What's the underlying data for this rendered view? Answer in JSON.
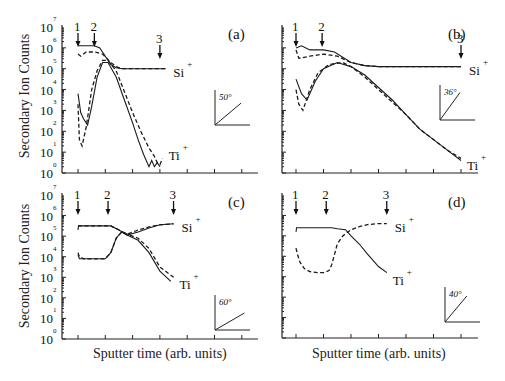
{
  "figure": {
    "ylabel": "Secondary Ion Counts",
    "xlabel": "Sputter time (arb. units)",
    "yticks_exp": [
      "0",
      "1",
      "2",
      "3",
      "4",
      "5",
      "6",
      "7"
    ],
    "ytick_base": "10"
  },
  "chart_data": [
    {
      "panel": "(a)",
      "type": "line",
      "angle_label": "50°",
      "angle_deg": 50,
      "xlabel": "",
      "ylabel": "Secondary Ion Counts",
      "yscale": "log",
      "ylim": [
        1,
        10000000
      ],
      "markers": [
        "1",
        "2",
        "3"
      ],
      "marker_x": [
        1.0,
        1.6,
        4.0
      ],
      "series_labels": [
        "Si+",
        "Ti+"
      ],
      "series": [
        {
          "name": "Si+ (solid)",
          "style": "solid",
          "x": [
            1.0,
            1.6,
            1.8,
            2.0,
            2.2,
            2.4,
            2.6,
            3.0,
            3.5,
            4.0,
            4.2
          ],
          "log10y": [
            6.1,
            6.1,
            6.0,
            5.6,
            5.2,
            5.05,
            5.0,
            5.0,
            5.0,
            5.0,
            5.0
          ]
        },
        {
          "name": "Si+ (dashed)",
          "style": "dashed",
          "x": [
            1.0,
            1.1,
            1.3,
            1.6,
            1.9,
            2.2,
            2.4,
            2.6,
            3.0,
            3.5,
            4.0,
            4.2
          ],
          "log10y": [
            5.7,
            5.6,
            5.8,
            5.8,
            5.7,
            5.3,
            5.1,
            5.0,
            5.0,
            5.0,
            5.0,
            5.0
          ]
        },
        {
          "name": "Ti+ (solid)",
          "style": "solid",
          "x": [
            1.0,
            1.1,
            1.2,
            1.35,
            1.5,
            1.7,
            1.9,
            2.1,
            2.4,
            2.7,
            3.0,
            3.2,
            3.4,
            3.6,
            3.7,
            3.8,
            3.9,
            4.0
          ],
          "log10y": [
            3.8,
            2.9,
            2.6,
            2.3,
            3.2,
            4.6,
            5.3,
            5.3,
            4.6,
            3.5,
            2.4,
            1.6,
            0.9,
            0.3,
            0.6,
            0.3,
            0.5,
            0.3
          ]
        },
        {
          "name": "Ti+ (dashed)",
          "style": "dashed",
          "x": [
            1.0,
            1.05,
            1.15,
            1.3,
            1.5,
            1.7,
            1.9,
            2.1,
            2.4,
            2.7,
            3.0,
            3.3,
            3.6,
            3.8,
            3.9,
            4.0,
            4.1
          ],
          "log10y": [
            3.3,
            1.6,
            1.3,
            2.2,
            4.0,
            4.9,
            5.4,
            5.4,
            4.9,
            3.9,
            2.9,
            2.0,
            1.2,
            0.8,
            0.5,
            0.4,
            0.7
          ]
        }
      ]
    },
    {
      "panel": "(b)",
      "type": "line",
      "angle_label": "36°",
      "angle_deg": 36,
      "yscale": "log",
      "ylim": [
        1,
        10000000
      ],
      "markers": [
        "1",
        "2",
        "3"
      ],
      "marker_x": [
        1.0,
        1.95,
        7.0
      ],
      "series_labels": [
        "Si+",
        "Ti+"
      ],
      "series": [
        {
          "name": "Si+ (solid)",
          "style": "solid",
          "x": [
            1.0,
            1.2,
            1.5,
            2.0,
            2.4,
            3.0,
            3.5,
            4.0,
            5.0,
            6.0,
            7.0
          ],
          "log10y": [
            6.0,
            6.1,
            5.9,
            5.9,
            5.8,
            5.3,
            5.15,
            5.1,
            5.1,
            5.1,
            5.1
          ]
        },
        {
          "name": "Si+ (dashed)",
          "style": "dashed",
          "x": [
            1.0,
            1.1,
            1.5,
            2.0,
            2.5,
            3.0,
            3.5,
            4.0,
            5.0,
            6.0,
            7.0
          ],
          "log10y": [
            5.9,
            5.5,
            5.6,
            5.7,
            5.6,
            5.3,
            5.15,
            5.1,
            5.1,
            5.1,
            5.1
          ]
        },
        {
          "name": "Ti+ (solid)",
          "style": "solid",
          "x": [
            1.0,
            1.2,
            1.4,
            1.7,
            2.0,
            2.5,
            3.0,
            3.5,
            4.0,
            4.5,
            5.0,
            5.5,
            6.0,
            6.5,
            7.0
          ],
          "log10y": [
            4.5,
            3.8,
            3.5,
            4.4,
            5.0,
            5.3,
            5.1,
            4.7,
            4.1,
            3.5,
            2.8,
            2.1,
            1.6,
            1.1,
            0.6
          ]
        },
        {
          "name": "Ti+ (dashed)",
          "style": "dashed",
          "x": [
            1.0,
            1.1,
            1.25,
            1.5,
            1.8,
            2.2,
            2.7,
            3.0,
            3.5,
            4.0,
            4.5,
            5.0,
            5.5,
            6.0,
            6.5,
            7.0
          ],
          "log10y": [
            4.0,
            3.3,
            3.0,
            4.0,
            4.8,
            5.2,
            5.3,
            5.1,
            4.6,
            4.0,
            3.4,
            2.8,
            2.1,
            1.6,
            1.1,
            0.7
          ]
        }
      ]
    },
    {
      "panel": "(c)",
      "type": "line",
      "angle_label": "60°",
      "angle_deg": 60,
      "yscale": "log",
      "ylim": [
        1,
        10000000
      ],
      "markers": [
        "1",
        "2",
        "3"
      ],
      "marker_x": [
        1.0,
        2.1,
        4.5
      ],
      "series_labels": [
        "Si+",
        "Ti+"
      ],
      "series": [
        {
          "name": "Si+ (solid)",
          "style": "solid",
          "x": [
            1.0,
            1.02,
            1.5,
            2.0,
            2.2,
            2.5,
            2.8,
            3.2,
            3.6,
            4.0,
            4.5
          ],
          "log10y": [
            5.3,
            5.5,
            5.5,
            5.5,
            5.5,
            5.3,
            5.05,
            5.2,
            5.4,
            5.55,
            5.6
          ]
        },
        {
          "name": "Si+ (dashed)",
          "style": "dashed",
          "x": [
            1.0,
            1.5,
            2.0,
            2.2,
            2.5,
            2.8,
            3.2,
            3.6,
            4.0,
            4.5
          ],
          "log10y": [
            5.5,
            5.5,
            5.5,
            5.5,
            5.3,
            5.1,
            5.3,
            5.45,
            5.55,
            5.6
          ]
        },
        {
          "name": "Ti+ (solid)",
          "style": "solid",
          "x": [
            1.0,
            1.05,
            1.2,
            1.5,
            2.0,
            2.2,
            2.4,
            2.6,
            2.8,
            3.2,
            3.6,
            4.0,
            4.4
          ],
          "log10y": [
            4.1,
            3.9,
            3.9,
            3.9,
            3.9,
            4.2,
            4.9,
            5.2,
            5.05,
            4.8,
            4.2,
            3.3,
            2.8
          ]
        },
        {
          "name": "Ti+ (dashed)",
          "style": "dashed",
          "x": [
            1.0,
            1.05,
            1.2,
            1.5,
            2.0,
            2.2,
            2.4,
            2.6,
            2.8,
            3.2,
            3.6,
            4.0,
            4.5
          ],
          "log10y": [
            4.2,
            4.0,
            3.9,
            3.9,
            3.9,
            4.2,
            4.9,
            5.2,
            5.1,
            4.9,
            4.4,
            3.5,
            3.0
          ]
        }
      ]
    },
    {
      "panel": "(d)",
      "type": "line",
      "angle_label": "40°",
      "angle_deg": 40,
      "yscale": "log",
      "ylim": [
        1,
        10000000
      ],
      "markers": [
        "1",
        "2",
        "3"
      ],
      "marker_x": [
        1.0,
        2.1,
        4.3
      ],
      "series_labels": [
        "Si+",
        "Ti+"
      ],
      "series": [
        {
          "name": "Si+",
          "style": "solid",
          "x": [
            1.0,
            1.02,
            1.5,
            2.0,
            2.3,
            2.5,
            2.8,
            3.0,
            3.3,
            3.6,
            4.0,
            4.3
          ],
          "log10y": [
            5.2,
            5.4,
            5.4,
            5.4,
            5.4,
            5.35,
            5.3,
            5.0,
            4.6,
            4.1,
            3.5,
            3.2
          ]
        },
        {
          "name": "Ti+",
          "style": "dashed",
          "x": [
            1.0,
            1.05,
            1.15,
            1.3,
            1.5,
            1.8,
            2.0,
            2.2,
            2.3,
            2.5,
            2.7,
            3.0,
            3.3,
            3.6,
            4.0,
            4.3
          ],
          "log10y": [
            4.4,
            4.1,
            3.7,
            3.4,
            3.25,
            3.2,
            3.2,
            3.3,
            3.6,
            4.6,
            5.0,
            5.3,
            5.45,
            5.55,
            5.6,
            5.6
          ]
        }
      ]
    }
  ]
}
